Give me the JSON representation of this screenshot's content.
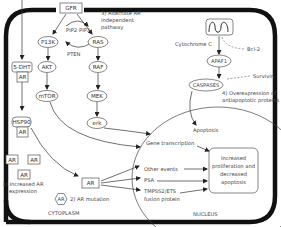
{
  "diagram": {
    "regions": {
      "cytoplasm": "CYTOPLASM",
      "nucleus": "NUCLEUS"
    },
    "receptor": "GFR",
    "alternate_pathway_label": [
      "3) Alternate AR",
      "independent",
      "pathway"
    ],
    "pi3k_pathway": {
      "pip2": "PIP2",
      "pip3": "PIP3",
      "pten": "PTEN",
      "nodes": [
        "P13K",
        "AKT",
        "mTOR"
      ]
    },
    "mapk_pathway": {
      "nodes": [
        "RAS",
        "RAF",
        "MEK",
        "erk"
      ]
    },
    "androgen": {
      "dht": "5-DHT",
      "ar": "AR",
      "hsp90": "HSP90"
    },
    "ar_boxes": [
      "AR",
      "AR",
      "AR"
    ],
    "increased_ar_label": [
      "1) Increased AR",
      "expression"
    ],
    "ar_mutation": {
      "hexagon": "AR",
      "label": "2) AR mutation"
    },
    "ar_active": "AR",
    "apoptosis_pathway": {
      "cytochrome": "Cytochrome C",
      "bcl2": "Bcl-2",
      "apaf1": "APAF1",
      "survivin": "Survivin",
      "caspases": "CASPASES",
      "overexpression_label": [
        "4) Overexpression of",
        "antiapoptotic proteins"
      ]
    },
    "nucleus_items": {
      "apoptosis": "Apoptosis",
      "gene_transcription": "Gene transcription",
      "other_events": "Other events",
      "psa": "PSA",
      "tmpss2": [
        "TMPSS2/ETS",
        "fusion protein"
      ]
    },
    "outcome": [
      "Increased",
      "proliferation and",
      "decreased",
      "apoptosis"
    ],
    "colors": {
      "cell_border": "#111111",
      "node_stroke": "#555555",
      "text": "#333333",
      "background": "#ffffff"
    }
  }
}
